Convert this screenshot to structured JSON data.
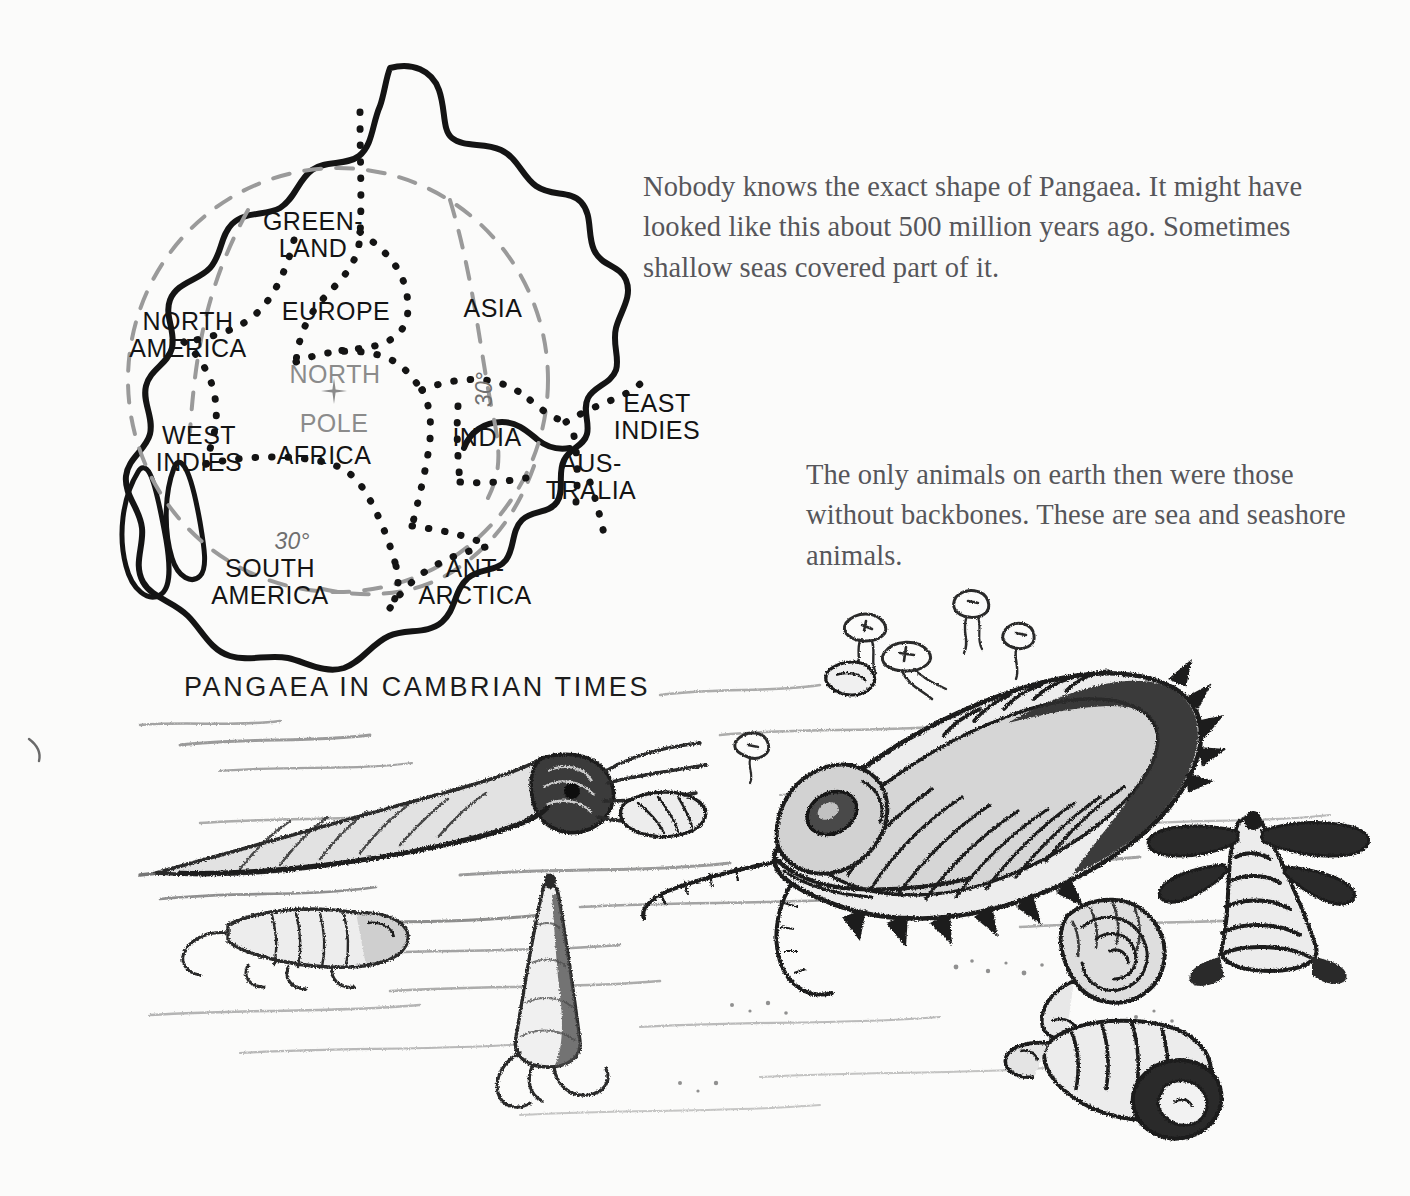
{
  "page": {
    "background_color": "#fbfbfa",
    "ink_color": "#141414",
    "text_color": "#56565a"
  },
  "map": {
    "caption": "PANGAEA IN CAMBRIAN TIMES",
    "pole_marker_icon": "plus-cross-icon",
    "labels": [
      {
        "name": "greenland",
        "text": "GREEN-\nLAND",
        "x": 253,
        "y": 158,
        "gray": false
      },
      {
        "name": "north-america",
        "text": "NORTH\nAMERICA",
        "x": 128,
        "y": 258,
        "gray": false
      },
      {
        "name": "europe",
        "text": "EUROPE",
        "x": 276,
        "y": 248,
        "gray": false
      },
      {
        "name": "asia",
        "text": "ASIA",
        "x": 433,
        "y": 245,
        "gray": false
      },
      {
        "name": "north-pole",
        "text": "NORTH",
        "x": 275,
        "y": 311,
        "gray": true
      },
      {
        "name": "pole",
        "text": "POLE",
        "x": 274,
        "y": 360,
        "gray": true
      },
      {
        "name": "africa",
        "text": "AFRICA",
        "x": 264,
        "y": 392,
        "gray": false
      },
      {
        "name": "west-indies",
        "text": "WEST\nINDIES",
        "x": 139,
        "y": 372,
        "gray": false
      },
      {
        "name": "india",
        "text": "INDIA",
        "x": 427,
        "y": 374,
        "gray": false
      },
      {
        "name": "east-indies",
        "text": "EAST\nINDIES",
        "x": 597,
        "y": 340,
        "gray": false
      },
      {
        "name": "australia",
        "text": "AUS-\nTRALIA",
        "x": 531,
        "y": 400,
        "gray": false
      },
      {
        "name": "south-america",
        "text": "SOUTH\nAMERICA",
        "x": 210,
        "y": 505,
        "gray": false
      },
      {
        "name": "antarctica",
        "text": "ANT-\nARCTICA",
        "x": 415,
        "y": 505,
        "gray": false
      }
    ],
    "latitude_labels": [
      {
        "name": "latitude-30-asia",
        "text": "30°",
        "x": 424,
        "y": 326,
        "rotated": true
      },
      {
        "name": "latitude-30-south",
        "text": "30°",
        "x": 232,
        "y": 478,
        "rotated": false
      }
    ]
  },
  "paragraphs": {
    "one": "Nobody knows the exact shape of Pangaea. It might have looked like this about 500 million years ago. Sometimes shallow seas covered part of it.",
    "two": "The only animals on earth then were those without backbones. These are sea and seashore animals."
  },
  "illustration": {
    "name": "cambrian-seafloor-scene",
    "subjects": [
      "large-trilobite",
      "small-trilobite",
      "straight-shelled-nautiloid",
      "conical-shell",
      "coiled-gastropod-shell",
      "turret-shell",
      "winged-cone-shell",
      "floating-jellyfish"
    ]
  }
}
